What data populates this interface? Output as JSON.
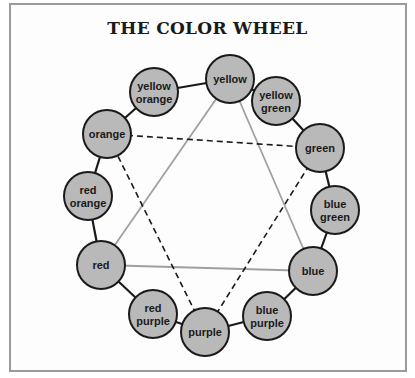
{
  "title": "THE COLOR WHEEL",
  "colors": {
    "circle_fill": "#b9b9b9",
    "circle_stroke": "#1a1a1a",
    "primary_triangle": "#a0a0a0",
    "secondary_triangle": "#1a1a1a",
    "frame": "#9a9a9a"
  },
  "wheel": [
    {
      "name": "yellow",
      "lines": [
        "yellow"
      ],
      "x": 230,
      "y": 79
    },
    {
      "name": "yellow green",
      "lines": [
        "yellow",
        "green"
      ],
      "x": 276,
      "y": 101
    },
    {
      "name": "green",
      "lines": [
        "green"
      ],
      "x": 320,
      "y": 148
    },
    {
      "name": "blue green",
      "lines": [
        "blue",
        "green"
      ],
      "x": 335,
      "y": 210
    },
    {
      "name": "blue",
      "lines": [
        "blue"
      ],
      "x": 313,
      "y": 271
    },
    {
      "name": "blue purple",
      "lines": [
        "blue",
        "purple"
      ],
      "x": 267,
      "y": 316
    },
    {
      "name": "purple",
      "lines": [
        "purple"
      ],
      "x": 205,
      "y": 332
    },
    {
      "name": "red purple",
      "lines": [
        "red",
        "purple"
      ],
      "x": 153,
      "y": 314
    },
    {
      "name": "red",
      "lines": [
        "red"
      ],
      "x": 101,
      "y": 265
    },
    {
      "name": "red orange",
      "lines": [
        "red",
        "orange"
      ],
      "x": 88,
      "y": 196
    },
    {
      "name": "orange",
      "lines": [
        "orange"
      ],
      "x": 107,
      "y": 134
    },
    {
      "name": "yellow orange",
      "lines": [
        "yellow",
        "orange"
      ],
      "x": 154,
      "y": 92
    }
  ],
  "primary_triangle": [
    "yellow",
    "blue",
    "red"
  ],
  "secondary_triangle": [
    "orange",
    "green",
    "purple"
  ]
}
